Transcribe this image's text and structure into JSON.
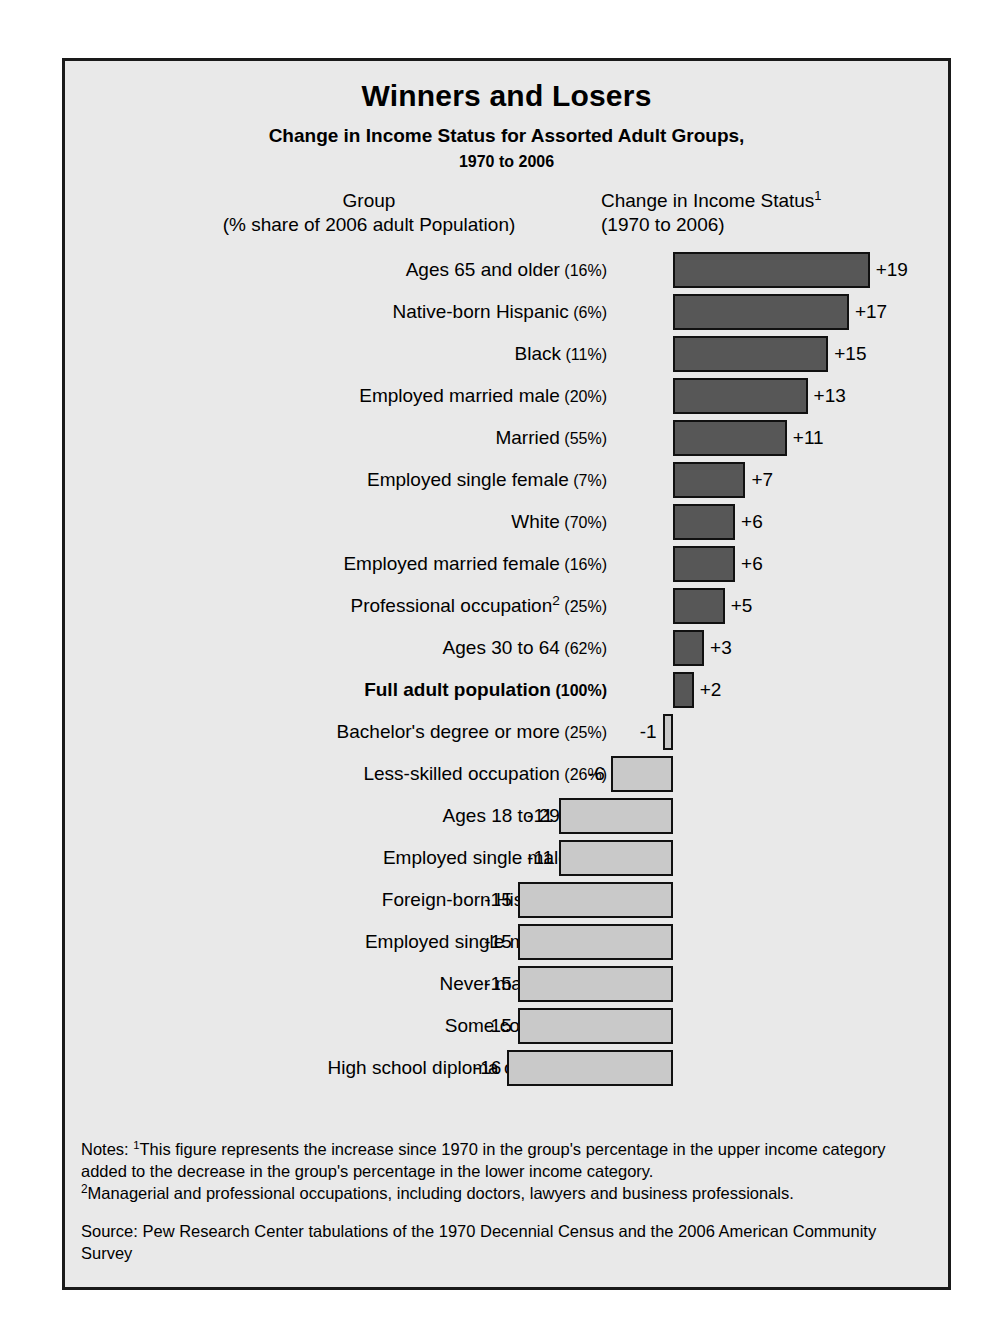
{
  "figure": {
    "title": "Winners and Losers",
    "subtitle": "Change in Income Status for Assorted Adult Groups,",
    "subtitle2": "1970 to 2006",
    "header_left_line1": "Group",
    "header_left_line2": "(% share of 2006 adult Population)",
    "header_right_line1": "Change in Income Status",
    "header_right_footnote": "1",
    "header_right_line2": "(1970 to 2006)",
    "notes_label": "Notes:",
    "note1_marker": "1",
    "note1_text": "This figure represents the increase since 1970 in the group's percentage in the upper income category added to the decrease in the group's percentage in the lower income category.",
    "note2_marker": "2",
    "note2_text": "Managerial and professional occupations, including doctors, lawyers and business professionals.",
    "source": "Source: Pew Research Center tabulations of the 1970 Decennial Census and the 2006 American Community Survey",
    "colors": {
      "positive_bar": "#575757",
      "negative_bar": "#c9c9c9",
      "panel_background": "#e9e9e9",
      "border": "#1a1a1a",
      "text": "#000000"
    }
  },
  "chart_data": {
    "type": "bar",
    "orientation": "horizontal",
    "title": "Winners and Losers",
    "subtitle": "Change in Income Status for Assorted Adult Groups, 1970 to 2006",
    "xlabel": "Change in Income Status (1970 to 2006)",
    "ylabel": "Group (% share of 2006 adult Population)",
    "xlim": [
      -16,
      19
    ],
    "grid": false,
    "legend": null,
    "zero_axis": 0,
    "categories": [
      "Ages 65 and older (16%)",
      "Native-born Hispanic (6%)",
      "Black (11%)",
      "Employed married male (20%)",
      "Married (55%)",
      "Employed single female (7%)",
      "White (70%)",
      "Employed married female (16%)",
      "Professional occupation2 (25%)",
      "Ages 30 to 64 (62%)",
      "Full adult population (100%)",
      "Bachelor's degree or more (25%)",
      "Less-skilled occupation (26%)",
      "Ages 18 to 29 (21%)",
      "Employed single male (9%)",
      "Foreign-born Hispanic (8%)",
      "Employed single mother (9%)",
      "Never married (25%)",
      "Some college (28%)",
      "High school diploma or less (47%)"
    ],
    "values": [
      19,
      17,
      15,
      13,
      11,
      7,
      6,
      6,
      5,
      3,
      2,
      -1,
      -6,
      -11,
      -11,
      -15,
      -15,
      -15,
      -15,
      -16
    ],
    "value_labels": [
      "+19",
      "+17",
      "+15",
      "+13",
      "+11",
      "+7",
      "+6",
      "+6",
      "+5",
      "+3",
      "+2",
      "-1",
      "-6",
      "-11",
      "-11",
      "-15",
      "-15",
      "-15",
      "-15",
      "-16"
    ],
    "rows": [
      {
        "name": "Ages 65 and older",
        "share": "(16%)",
        "value": 19,
        "label": "+19",
        "bold": false,
        "footnote": null
      },
      {
        "name": "Native-born Hispanic",
        "share": "(6%)",
        "value": 17,
        "label": "+17",
        "bold": false,
        "footnote": null
      },
      {
        "name": "Black",
        "share": "(11%)",
        "value": 15,
        "label": "+15",
        "bold": false,
        "footnote": null
      },
      {
        "name": "Employed married male",
        "share": "(20%)",
        "value": 13,
        "label": "+13",
        "bold": false,
        "footnote": null
      },
      {
        "name": "Married",
        "share": "(55%)",
        "value": 11,
        "label": "+11",
        "bold": false,
        "footnote": null
      },
      {
        "name": "Employed single female",
        "share": "(7%)",
        "value": 7,
        "label": "+7",
        "bold": false,
        "footnote": null
      },
      {
        "name": "White",
        "share": "(70%)",
        "value": 6,
        "label": "+6",
        "bold": false,
        "footnote": null
      },
      {
        "name": "Employed married female",
        "share": "(16%)",
        "value": 6,
        "label": "+6",
        "bold": false,
        "footnote": null
      },
      {
        "name": "Professional occupation",
        "share": "(25%)",
        "value": 5,
        "label": "+5",
        "bold": false,
        "footnote": "2"
      },
      {
        "name": "Ages 30 to 64",
        "share": "(62%)",
        "value": 3,
        "label": "+3",
        "bold": false,
        "footnote": null
      },
      {
        "name": "Full adult population",
        "share": "(100%)",
        "value": 2,
        "label": "+2",
        "bold": true,
        "footnote": null
      },
      {
        "name": "Bachelor's degree or more",
        "share": "(25%)",
        "value": -1,
        "label": "-1",
        "bold": false,
        "footnote": null
      },
      {
        "name": "Less-skilled occupation",
        "share": "(26%)",
        "value": -6,
        "label": "-6",
        "bold": false,
        "footnote": null
      },
      {
        "name": "Ages 18 to 29",
        "share": "(21%)",
        "value": -11,
        "label": "-11",
        "bold": false,
        "footnote": null
      },
      {
        "name": "Employed single male",
        "share": "(9%)",
        "value": -11,
        "label": "-11",
        "bold": false,
        "footnote": null
      },
      {
        "name": "Foreign-born Hispanic",
        "share": "(8%)",
        "value": -15,
        "label": "-15",
        "bold": false,
        "footnote": null
      },
      {
        "name": "Employed single mother",
        "share": "(9%)",
        "value": -15,
        "label": "-15",
        "bold": false,
        "footnote": null
      },
      {
        "name": "Never married",
        "share": "(25%)",
        "value": -15,
        "label": "-15",
        "bold": false,
        "footnote": null
      },
      {
        "name": "Some college",
        "share": "(28%)",
        "value": -15,
        "label": "-15",
        "bold": false,
        "footnote": null
      },
      {
        "name": "High school diploma or less",
        "share": "(47%)",
        "value": -16,
        "label": "-16",
        "bold": false,
        "footnote": null
      }
    ]
  }
}
